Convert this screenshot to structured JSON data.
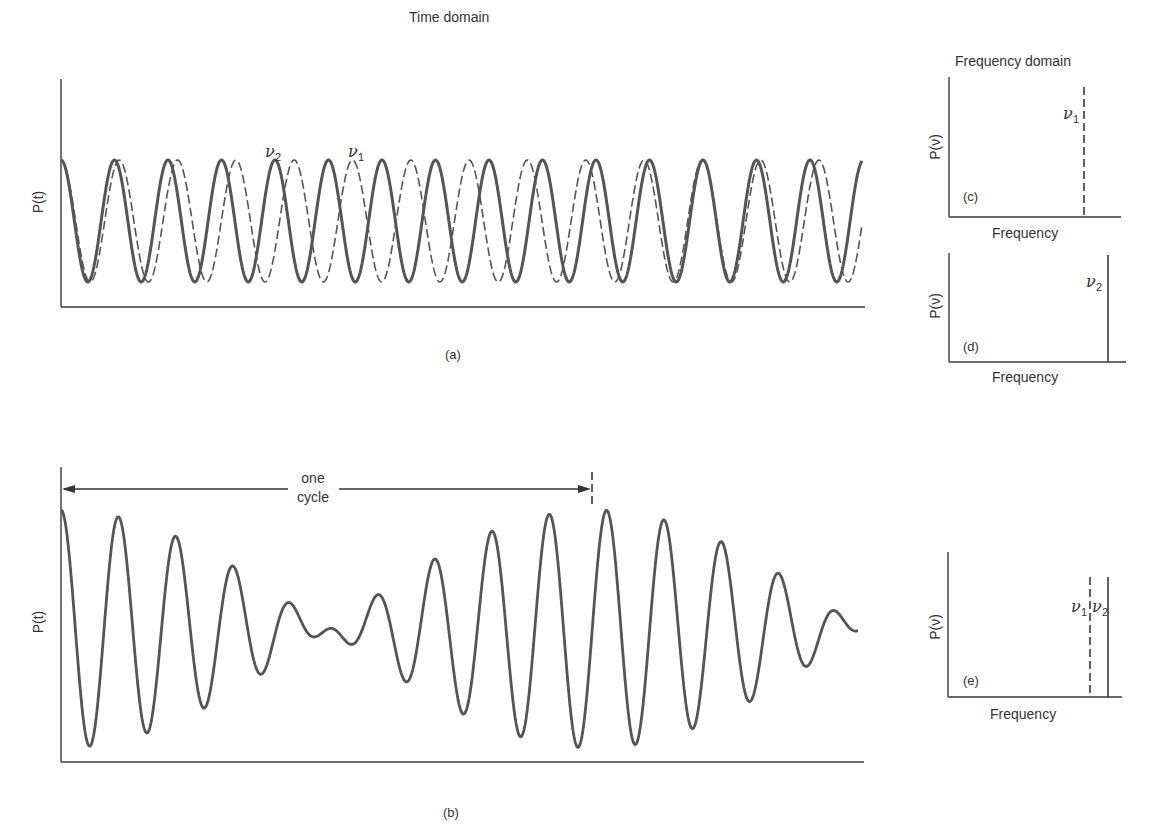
{
  "titles": {
    "time_domain": "Time domain",
    "frequency_domain": "Frequency domain"
  },
  "panels": {
    "a": {
      "caption": "(a)",
      "ylabel": "P(t)",
      "labels": {
        "nu2": "ν",
        "nu2_sub": "2",
        "nu1": "ν",
        "nu1_sub": "1"
      }
    },
    "b": {
      "caption": "(b)",
      "ylabel": "P(t)",
      "cycle_label_line1": "one",
      "cycle_label_line2": "cycle"
    },
    "c": {
      "caption": "(c)",
      "ylabel": "P(ν)",
      "xlabel": "Frequency",
      "line_label": "ν",
      "line_label_sub": "1"
    },
    "d": {
      "caption": "(d)",
      "ylabel": "P(ν)",
      "xlabel": "Frequency",
      "line_label": "ν",
      "line_label_sub": "2"
    },
    "e": {
      "caption": "(e)",
      "ylabel": "P(ν)",
      "xlabel": "Frequency",
      "line1_label": "ν",
      "line1_label_sub": "1",
      "line2_label": "ν",
      "line2_label_sub": "2"
    }
  },
  "chart_data": [
    {
      "panel": "a",
      "type": "line",
      "title": "Time domain",
      "xlabel": "",
      "ylabel": "P(t)",
      "description": "Two cosine waves of slightly different frequency overlaid",
      "series": [
        {
          "name": "ν2",
          "style": "solid",
          "period_px": 53.5,
          "amplitude_px": 61,
          "phase_start": "peak"
        },
        {
          "name": "ν1",
          "style": "dashed",
          "period_px": 58.3,
          "amplitude_px": 61,
          "phase_start": "peak"
        }
      ],
      "grid": false
    },
    {
      "panel": "b",
      "type": "line",
      "title": "",
      "xlabel": "",
      "ylabel": "P(t)",
      "description": "Sum of ν1 and ν2 showing beats; one beat cycle annotated",
      "series": [
        {
          "name": "ν1 + ν2",
          "style": "solid",
          "period1_px": 54.5,
          "period2_px": 60.7,
          "amplitude_each_px": 59.5
        }
      ],
      "annotations": [
        {
          "text": "one cycle",
          "type": "double-arrow",
          "span_px": 531
        }
      ],
      "grid": false
    },
    {
      "panel": "c",
      "type": "bar",
      "xlabel": "Frequency",
      "ylabel": "P(ν)",
      "categories": [
        "ν1"
      ],
      "values": [
        1
      ],
      "style": "dashed",
      "relative_x": 0.79
    },
    {
      "panel": "d",
      "type": "bar",
      "xlabel": "Frequency",
      "ylabel": "P(ν)",
      "categories": [
        "ν2"
      ],
      "values": [
        1
      ],
      "style": "solid",
      "relative_x": 0.9
    },
    {
      "panel": "e",
      "type": "bar",
      "xlabel": "Frequency",
      "ylabel": "P(ν)",
      "categories": [
        "ν1",
        "ν2"
      ],
      "values": [
        1,
        1
      ],
      "styles": [
        "dashed",
        "solid"
      ],
      "relative_x": [
        0.82,
        0.92
      ]
    }
  ]
}
